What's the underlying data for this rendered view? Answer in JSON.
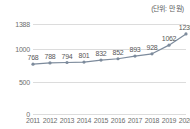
{
  "unit_note": "(단위: 만 원)",
  "chart_data": {
    "type": "line",
    "title": "",
    "subtitle": "",
    "xlabel": "",
    "ylabel": "",
    "unit_label": "(단위: 만 원)",
    "categories": [
      "2011",
      "2012",
      "2013",
      "2014",
      "2015",
      "2016",
      "2017",
      "2018",
      "2019",
      "2020"
    ],
    "values": [
      768,
      788,
      794,
      801,
      832,
      852,
      893,
      928,
      1062,
      1235
    ],
    "point_labels": [
      "768",
      "788",
      "794",
      "801",
      "832",
      "852",
      "893",
      "928",
      "1062",
      "1235"
    ],
    "series": [
      {
        "name": "",
        "values": [
          768,
          788,
          794,
          801,
          832,
          852,
          893,
          928,
          1062,
          1235
        ]
      }
    ],
    "ylim": [
      0,
      1388
    ],
    "yticks": [
      0,
      500,
      1000,
      1388
    ],
    "ytick_labels": [
      "0",
      "500",
      "1000",
      "1388"
    ],
    "grid": "horizontal",
    "legend": "none",
    "line_color": "#7d8b9c",
    "marker_color": "#7d8b9c",
    "grid_color": "#dcdcdc",
    "background_color": "#ffffff",
    "label_color": "#585858"
  }
}
